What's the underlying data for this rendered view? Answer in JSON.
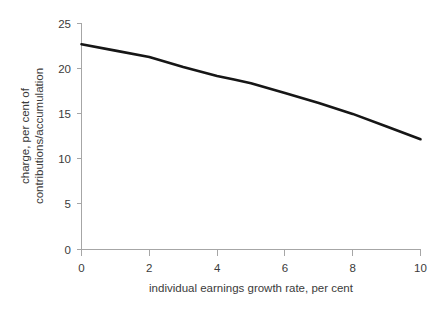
{
  "chart_data": {
    "type": "line",
    "title": "",
    "xlabel": "individual earnings growth rate, per cent",
    "ylabel_line1": "charge, per cent of",
    "ylabel_line2": "contributions/accumulation",
    "ylabel": "charge, per cent of contributions/accumulation",
    "xlim": [
      0,
      10
    ],
    "ylim": [
      0,
      25
    ],
    "xticks": [
      0,
      2,
      4,
      6,
      8,
      10
    ],
    "yticks": [
      0,
      5,
      10,
      15,
      20,
      25
    ],
    "xtick_labels": [
      "0",
      "2",
      "4",
      "6",
      "8",
      "10"
    ],
    "ytick_labels": [
      "0",
      "5",
      "10",
      "15",
      "20",
      "25"
    ],
    "grid": false,
    "legend": "none",
    "series": [
      {
        "name": "charge",
        "color": "#161616",
        "x": [
          0,
          1,
          2,
          3,
          4,
          4.5,
          5,
          6,
          7,
          8,
          9,
          10
        ],
        "values": [
          22.7,
          22.0,
          21.3,
          20.2,
          19.2,
          18.8,
          18.4,
          17.3,
          16.2,
          15.0,
          13.6,
          12.2
        ]
      }
    ]
  },
  "axes": {
    "axis_color": "#a6a6a6",
    "label_color": "#3b3b3b"
  }
}
